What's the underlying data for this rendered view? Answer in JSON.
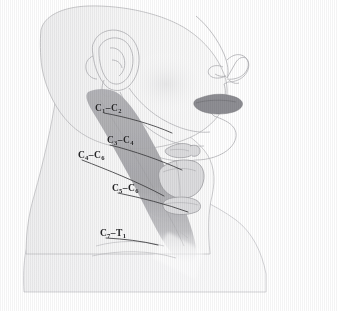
{
  "figure": {
    "view_direction": "facing right",
    "style": "grayscale scanned medical line illustration with vertical scan striping"
  },
  "colors": {
    "background": "#ffffff",
    "skin_fill": "#f4f4f4",
    "skin_outline": "#b9b9bc",
    "band_fill": "#a9a9ad",
    "band_fill_light": "#c3c3c7",
    "lips_fill": "#8e8e93",
    "leader_line": "#3a3a3c",
    "label_text": "#262628",
    "cartilage_fill": "#dcdcde",
    "cartilage_outline": "#9a9a9e"
  },
  "labels": [
    {
      "id": "c1-c2",
      "segment": "C1-C2",
      "upper": "C",
      "sub1": "1",
      "dash": "–",
      "upper2": "C",
      "sub2": "2",
      "x": 95,
      "y": 104
    },
    {
      "id": "c3-c4",
      "segment": "C3-C4",
      "upper": "C",
      "sub1": "3",
      "dash": "–",
      "upper2": "C",
      "sub2": "4",
      "x": 107,
      "y": 136
    },
    {
      "id": "c4-c6",
      "segment": "C4-C6",
      "upper": "C",
      "sub1": "4",
      "dash": "–",
      "upper2": "C",
      "sub2": "6",
      "x": 78,
      "y": 151
    },
    {
      "id": "c5-c6",
      "segment": "C5-C6",
      "upper": "C",
      "sub1": "5",
      "dash": "–",
      "upper2": "C",
      "sub2": "6",
      "x": 112,
      "y": 184
    },
    {
      "id": "c7-t1",
      "segment": "C7-T1",
      "upper": "C",
      "sub1": "7",
      "dash": "–",
      "upper2": "T",
      "sub2": "1",
      "x": 100,
      "y": 229
    }
  ],
  "anatomy_parts": [
    {
      "id": "head",
      "name": "head-silhouette"
    },
    {
      "id": "ear",
      "name": "auricle-outline"
    },
    {
      "id": "nose",
      "name": "nose-profile"
    },
    {
      "id": "lips",
      "name": "lips"
    },
    {
      "id": "mandible",
      "name": "mandible-jawline"
    },
    {
      "id": "neck",
      "name": "neck"
    },
    {
      "id": "shoulder",
      "name": "shoulder-trapezius"
    },
    {
      "id": "hyoid",
      "name": "hyoid-bone"
    },
    {
      "id": "thyroid-cart",
      "name": "thyroid-cartilage"
    },
    {
      "id": "cricoid",
      "name": "cricoid-cartilage"
    },
    {
      "id": "dermatome-band",
      "name": "cervical-dermatome-band"
    }
  ]
}
